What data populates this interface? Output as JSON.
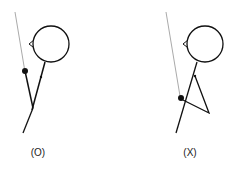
{
  "figures": [
    {
      "id": "correct",
      "label": "(O)"
    },
    {
      "id": "incorrect",
      "label": "(X)"
    }
  ],
  "colors": {
    "stroke": "#111111",
    "pole": "#aaaaaa",
    "background": "#ffffff"
  }
}
